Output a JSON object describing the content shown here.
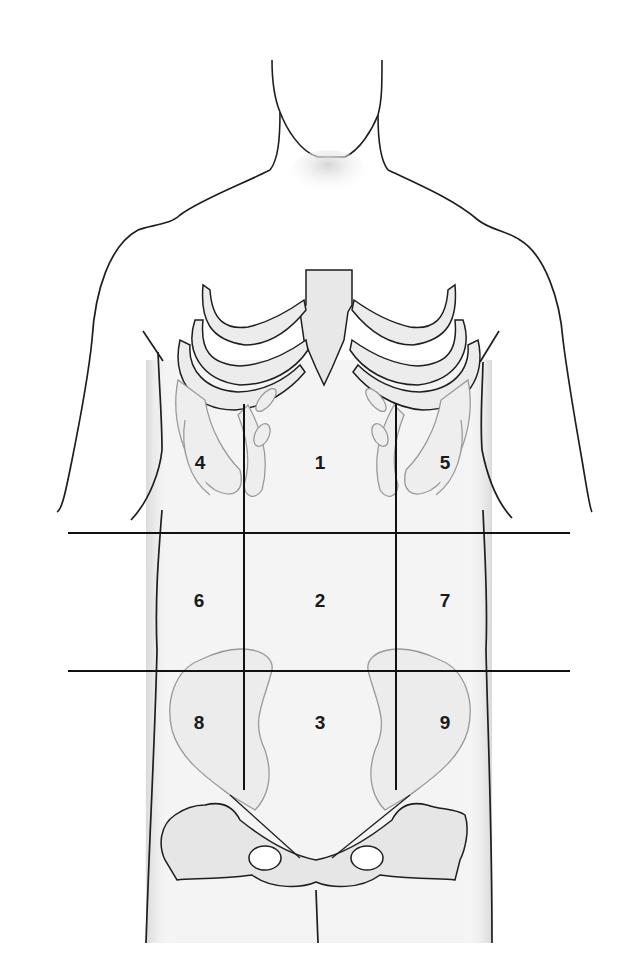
{
  "diagram": {
    "colors": {
      "outline": "#1e1e1e",
      "bone_fill": "#e6e6e6",
      "bone_outline": "#9a9a9a",
      "skin_shade": "#efefef",
      "divider_line": "#111111",
      "label": "#1a1a1a"
    },
    "dividers": {
      "horizontal": [
        {
          "name": "subcostal-plane",
          "y": 533,
          "x1": 68,
          "x2": 570
        },
        {
          "name": "intertubercular-plane",
          "y": 671,
          "x1": 68,
          "x2": 570
        }
      ],
      "vertical": [
        {
          "name": "right-midclavicular-line",
          "x": 244,
          "y1": 404,
          "y2": 790
        },
        {
          "name": "left-midclavicular-line",
          "x": 396,
          "y1": 404,
          "y2": 790
        }
      ]
    },
    "regions": [
      {
        "id": "1",
        "label": "1",
        "x": 320,
        "y": 462
      },
      {
        "id": "2",
        "label": "2",
        "x": 320,
        "y": 600
      },
      {
        "id": "3",
        "label": "3",
        "x": 320,
        "y": 722
      },
      {
        "id": "4",
        "label": "4",
        "x": 200,
        "y": 462
      },
      {
        "id": "5",
        "label": "5",
        "x": 445,
        "y": 462
      },
      {
        "id": "6",
        "label": "6",
        "x": 199,
        "y": 600
      },
      {
        "id": "7",
        "label": "7",
        "x": 445,
        "y": 600
      },
      {
        "id": "8",
        "label": "8",
        "x": 199,
        "y": 722
      },
      {
        "id": "9",
        "label": "9",
        "x": 445,
        "y": 722
      }
    ]
  }
}
